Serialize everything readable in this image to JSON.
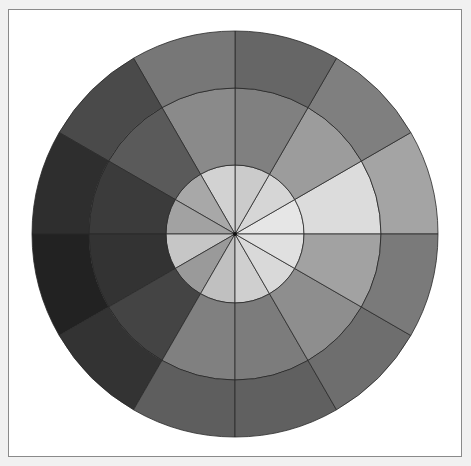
{
  "figure": {
    "type": "polar-grayscale-wheel",
    "sectors": 12,
    "sector_angle_deg": 30,
    "center": [
      235,
      234
    ],
    "radii": {
      "inner": 69,
      "middle": 146,
      "outer": 203
    },
    "angle_origin": "east, counter-clockwise",
    "stroke_color": "#2a2a2a",
    "rings": {
      "outer": [
        "#a4a4a4",
        "#7f7f7f",
        "#666666",
        "#777777",
        "#4a4a4a",
        "#2e2e2e",
        "#222222",
        "#333333",
        "#5e5e5e",
        "#606060",
        "#6e6e6e",
        "#7a7a7a"
      ],
      "middle": [
        "#dcdcdc",
        "#9c9c9c",
        "#808080",
        "#8a8a8a",
        "#5a5a5a",
        "#3b3b3b",
        "#333333",
        "#444444",
        "#808080",
        "#7c7c7c",
        "#8e8e8e",
        "#a2a2a2"
      ],
      "inner": [
        "#e6e6e6",
        "#d6d6d6",
        "#cbcbcb",
        "#d2d2d2",
        "#a8a8a8",
        "#a2a2a2",
        "#c6c6c6",
        "#9a9a9a",
        "#c0c0c0",
        "#cfcfcf",
        "#d9d9d9",
        "#e0e0e0"
      ]
    }
  }
}
